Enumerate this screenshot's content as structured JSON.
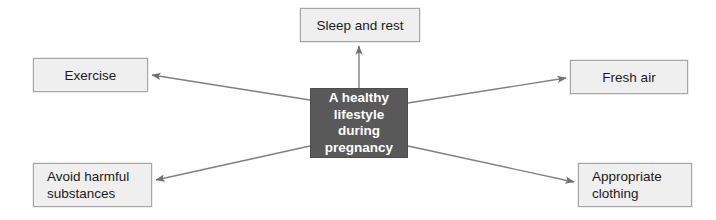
{
  "diagram": {
    "type": "spider-map",
    "background_color": "#ffffff",
    "canvas": {
      "width": 716,
      "height": 220
    },
    "center": {
      "id": "center",
      "text": "A healthy\nlifestyle\nduring\npregnancy",
      "fill_color": "#595959",
      "text_color": "#ffffff",
      "x": 310,
      "y": 88,
      "w": 98,
      "h": 70
    },
    "nodes": [
      {
        "id": "sleep-and-rest",
        "text": "Sleep and rest",
        "align": "center",
        "fill_color": "#efefef",
        "border_color": "#a6a6a6",
        "text_color": "#1a1a1a",
        "x": 300,
        "y": 8,
        "w": 120,
        "h": 34
      },
      {
        "id": "exercise",
        "text": "Exercise",
        "align": "center",
        "fill_color": "#efefef",
        "border_color": "#a6a6a6",
        "text_color": "#1a1a1a",
        "x": 33,
        "y": 58,
        "w": 115,
        "h": 34
      },
      {
        "id": "fresh-air",
        "text": "Fresh air",
        "align": "center",
        "fill_color": "#efefef",
        "border_color": "#a6a6a6",
        "text_color": "#1a1a1a",
        "x": 570,
        "y": 60,
        "w": 118,
        "h": 34
      },
      {
        "id": "avoid-harmful-substances",
        "text": "Avoid harmful\nsubstances",
        "align": "left",
        "fill_color": "#efefef",
        "border_color": "#a6a6a6",
        "text_color": "#1a1a1a",
        "x": 33,
        "y": 163,
        "w": 119,
        "h": 44
      },
      {
        "id": "appropriate-clothing",
        "text": "Appropriate\nclothing",
        "align": "left",
        "fill_color": "#efefef",
        "border_color": "#a6a6a6",
        "text_color": "#1a1a1a",
        "x": 578,
        "y": 163,
        "w": 114,
        "h": 44
      }
    ],
    "connectors": [
      {
        "id": "arrow-to-sleep-and-rest",
        "from": "center",
        "to": "sleep-and-rest",
        "x1": 359,
        "y1": 88,
        "x2": 359,
        "y2": 46,
        "color": "#808080"
      },
      {
        "id": "arrow-to-exercise",
        "from": "center",
        "to": "exercise",
        "x1": 310,
        "y1": 100,
        "x2": 152,
        "y2": 75,
        "color": "#808080"
      },
      {
        "id": "arrow-to-fresh-air",
        "from": "center",
        "to": "fresh-air",
        "x1": 408,
        "y1": 103,
        "x2": 566,
        "y2": 78,
        "color": "#808080"
      },
      {
        "id": "arrow-to-avoid-harmful-substances",
        "from": "center",
        "to": "avoid-harmful-substances",
        "x1": 310,
        "y1": 146,
        "x2": 156,
        "y2": 180,
        "color": "#808080"
      },
      {
        "id": "arrow-to-appropriate-clothing",
        "from": "center",
        "to": "appropriate-clothing",
        "x1": 408,
        "y1": 146,
        "x2": 574,
        "y2": 182,
        "color": "#808080"
      }
    ]
  }
}
